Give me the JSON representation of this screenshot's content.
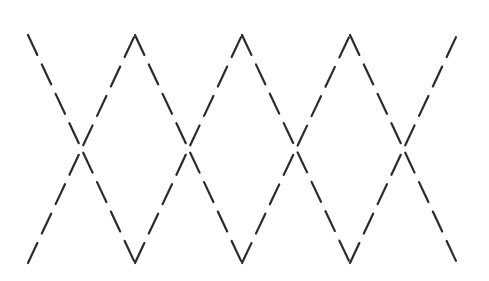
{
  "pattern": {
    "description": "Two dashed zigzag lines forming a crossed diamond (argyle) pattern",
    "background": "#ffffff",
    "stroke_color": "#2b2b2b",
    "stroke_width": 2.2,
    "dash_length": 22,
    "dash_gap": 10.5,
    "top_y": 35,
    "bottom_y": 263,
    "vertex_x": [
      28,
      135,
      242,
      350,
      457
    ],
    "crossing_y": 149,
    "lines": [
      {
        "name": "zigzag-top-start",
        "start": "top"
      },
      {
        "name": "zigzag-bottom-start",
        "start": "bottom"
      }
    ]
  }
}
